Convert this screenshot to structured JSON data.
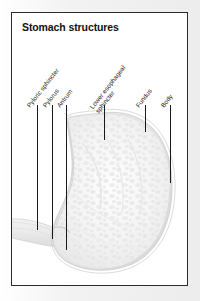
{
  "figure": {
    "title": "Stomach structures",
    "frame_color": "#2b2b2b",
    "page_background": "#f1f1f1",
    "panel_background": "#ffffff",
    "label_color": "#1c1c1c",
    "leader_color": "#1a1a1a",
    "illustration_name": "stomach-anatomy-grayscale"
  },
  "labels": [
    {
      "id": "pyloric-sphincter",
      "text": "Pyloric sphincter",
      "text_x": 16,
      "text_y": 90,
      "two_line": false,
      "leader_x": 25,
      "leader_top": 92,
      "leader_bottom": 217
    },
    {
      "id": "pylorus",
      "text": "Pylorus",
      "text_x": 32,
      "text_y": 90,
      "two_line": false,
      "leader_x": 40,
      "leader_top": 92,
      "leader_bottom": 226
    },
    {
      "id": "antrum",
      "text": "Antrum",
      "text_x": 46,
      "text_y": 90,
      "two_line": false,
      "leader_x": 54,
      "leader_top": 92,
      "leader_bottom": 237
    },
    {
      "id": "lower-esophageal-sphincter",
      "text": "Lower esophageal sphincter",
      "text_x": 82,
      "text_y": 90,
      "two_line": true,
      "leader_x": 92,
      "leader_top": 92,
      "leader_bottom": 127
    },
    {
      "id": "fundus",
      "text": "Fundus",
      "text_x": 125,
      "text_y": 90,
      "two_line": false,
      "leader_x": 133,
      "leader_top": 92,
      "leader_bottom": 119
    },
    {
      "id": "body",
      "text": "Body",
      "text_x": 150,
      "text_y": 90,
      "two_line": false,
      "leader_x": 158,
      "leader_top": 92,
      "leader_bottom": 170
    }
  ]
}
